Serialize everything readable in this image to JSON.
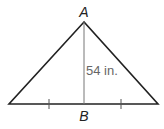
{
  "diagram": {
    "type": "isosceles-triangle",
    "vertices": {
      "apex_label": "A",
      "base_mid_label": "B"
    },
    "height_label": "54 in.",
    "base_tick_marks": 2,
    "colors": {
      "stroke": "#222222",
      "altitude": "#777777",
      "text": "#222222"
    }
  }
}
